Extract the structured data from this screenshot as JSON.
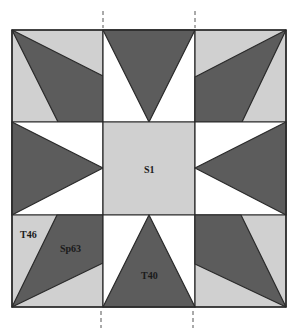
{
  "diagram": {
    "colors": {
      "light": "#d0d0d0",
      "dark": "#5c5c5c",
      "white": "#ffffff",
      "line": "#2a2a2a"
    },
    "grid": {
      "cols": 3,
      "rows": 3
    },
    "labels": {
      "center": "S1",
      "corner_triangle": "T46",
      "corner_kite": "Sp63",
      "star_point": "T40"
    },
    "fold_guides": {
      "count": 4,
      "style": "dashed"
    }
  }
}
